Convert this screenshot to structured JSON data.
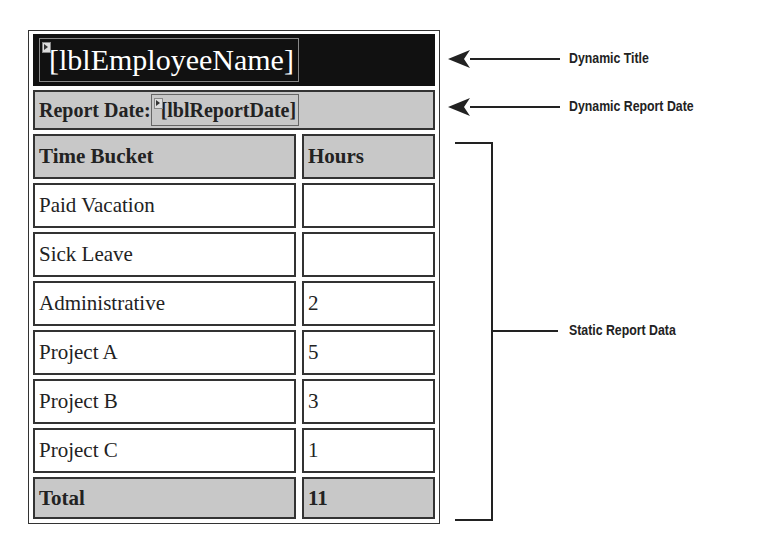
{
  "report": {
    "title_field": "lblEmployeeName",
    "report_date_label": "Report Date:",
    "report_date_field": "lblReportDate",
    "table": {
      "headers": [
        "Time Bucket",
        "Hours"
      ],
      "rows": [
        {
          "bucket": "Paid Vacation",
          "hours": ""
        },
        {
          "bucket": "Sick Leave",
          "hours": ""
        },
        {
          "bucket": "Administrative",
          "hours": "2"
        },
        {
          "bucket": "Project A",
          "hours": "5"
        },
        {
          "bucket": "Project B",
          "hours": "3"
        },
        {
          "bucket": "Project C",
          "hours": "1"
        }
      ],
      "total": {
        "label": "Total",
        "hours": "11"
      }
    }
  },
  "annotations": {
    "dynamic_title": "Dynamic Title",
    "dynamic_report_date": "Dynamic Report Date",
    "static_report_data": "Static Report Data"
  }
}
